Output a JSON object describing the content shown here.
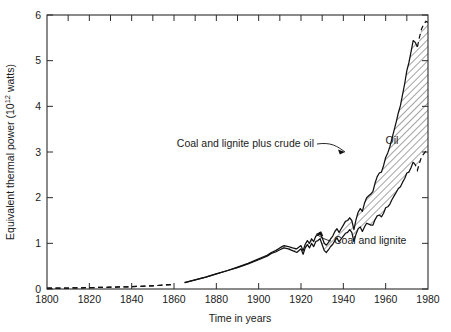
{
  "figure": {
    "background_color": "#ffffff",
    "line_color": "#111111",
    "frame_color": "#2b2b2b"
  },
  "axes": {
    "y_title": "Equivalent thermal power (10",
    "y_title_exponent": "12",
    "y_title_tail": " watts)",
    "x_title": "Time in years",
    "y_ticks": [
      "0",
      "1",
      "2",
      "3",
      "4",
      "5",
      "6"
    ],
    "x_ticks": [
      "1800",
      "1820",
      "1840",
      "1860",
      "1880",
      "1900",
      "1920",
      "1940",
      "1960",
      "1980"
    ]
  },
  "annotations": {
    "upper_curve": "Coal and lignite plus crude oil",
    "band": "Oil",
    "lower_curve": "Coal and lignite"
  },
  "chart_data": {
    "type": "area",
    "title": "",
    "subtitle": "",
    "xlabel": "Time in years",
    "ylabel": "Equivalent thermal power (10^12 watts)",
    "xlim": [
      1800,
      1980
    ],
    "ylim": [
      0,
      6
    ],
    "x_tick_interval_major": 20,
    "x_tick_interval_minor": 10,
    "y_tick_interval": 1,
    "grid": false,
    "legend": "inline-annotations",
    "hatch_region": {
      "label": "Oil",
      "between": [
        "Coal and lignite",
        "Coal and lignite plus crude oil"
      ],
      "pattern": "diagonal-45"
    },
    "series": [
      {
        "name": "Coal and lignite plus crude oil",
        "style": "solid-with-dashed-start-and-end",
        "dashed_x_ranges": [
          [
            1800,
            1862
          ],
          [
            1975,
            1980
          ]
        ],
        "x": [
          1800,
          1810,
          1820,
          1830,
          1840,
          1850,
          1860,
          1865,
          1870,
          1875,
          1880,
          1885,
          1890,
          1895,
          1900,
          1902,
          1904,
          1906,
          1908,
          1910,
          1912,
          1914,
          1916,
          1918,
          1920,
          1921,
          1922,
          1923,
          1924,
          1925,
          1926,
          1927,
          1928,
          1929,
          1930,
          1931,
          1932,
          1933,
          1934,
          1935,
          1936,
          1937,
          1938,
          1939,
          1940,
          1941,
          1942,
          1943,
          1944,
          1945,
          1946,
          1947,
          1948,
          1949,
          1950,
          1951,
          1952,
          1953,
          1954,
          1955,
          1956,
          1957,
          1958,
          1959,
          1960,
          1961,
          1962,
          1963,
          1964,
          1965,
          1966,
          1967,
          1968,
          1969,
          1970,
          1971,
          1972,
          1973,
          1974,
          1975,
          1976,
          1977,
          1978,
          1979,
          1980
        ],
        "y": [
          0.02,
          0.02,
          0.03,
          0.04,
          0.05,
          0.07,
          0.1,
          0.14,
          0.2,
          0.26,
          0.33,
          0.4,
          0.48,
          0.56,
          0.66,
          0.7,
          0.74,
          0.8,
          0.84,
          0.9,
          0.95,
          0.93,
          0.9,
          0.88,
          0.95,
          0.84,
          0.98,
          1.06,
          1.0,
          1.1,
          1.04,
          1.16,
          1.18,
          1.24,
          1.12,
          1.0,
          0.96,
          1.02,
          1.1,
          1.16,
          1.26,
          1.32,
          1.24,
          1.32,
          1.4,
          1.48,
          1.5,
          1.56,
          1.5,
          1.3,
          1.52,
          1.68,
          1.76,
          1.7,
          1.88,
          2.0,
          2.04,
          2.08,
          2.14,
          2.32,
          2.46,
          2.54,
          2.56,
          2.7,
          2.88,
          2.98,
          3.12,
          3.3,
          3.48,
          3.66,
          3.86,
          4.02,
          4.26,
          4.5,
          4.78,
          4.96,
          5.2,
          5.44,
          5.4,
          5.3,
          5.52,
          5.7,
          5.8,
          5.86,
          5.84
        ]
      },
      {
        "name": "Coal and lignite",
        "style": "solid-with-dashed-start-and-end",
        "dashed_x_ranges": [
          [
            1800,
            1862
          ],
          [
            1973,
            1980
          ]
        ],
        "x": [
          1800,
          1810,
          1820,
          1830,
          1840,
          1850,
          1860,
          1865,
          1870,
          1875,
          1880,
          1885,
          1890,
          1895,
          1900,
          1902,
          1904,
          1906,
          1908,
          1910,
          1912,
          1914,
          1916,
          1918,
          1920,
          1921,
          1922,
          1923,
          1924,
          1925,
          1926,
          1927,
          1928,
          1929,
          1930,
          1931,
          1932,
          1933,
          1934,
          1935,
          1936,
          1937,
          1938,
          1939,
          1940,
          1941,
          1942,
          1943,
          1944,
          1945,
          1946,
          1947,
          1948,
          1949,
          1950,
          1951,
          1952,
          1953,
          1954,
          1955,
          1956,
          1957,
          1958,
          1959,
          1960,
          1961,
          1962,
          1963,
          1964,
          1965,
          1966,
          1967,
          1968,
          1969,
          1970,
          1971,
          1972,
          1973,
          1974,
          1975,
          1976,
          1977,
          1978,
          1979,
          1980
        ],
        "y": [
          0.02,
          0.02,
          0.03,
          0.04,
          0.05,
          0.07,
          0.1,
          0.14,
          0.2,
          0.26,
          0.33,
          0.4,
          0.47,
          0.55,
          0.64,
          0.68,
          0.72,
          0.78,
          0.81,
          0.86,
          0.9,
          0.88,
          0.84,
          0.8,
          0.88,
          0.76,
          0.9,
          0.97,
          0.9,
          1.0,
          0.93,
          1.04,
          1.06,
          1.1,
          0.97,
          0.84,
          0.8,
          0.86,
          0.93,
          0.98,
          1.06,
          1.12,
          1.03,
          1.1,
          1.16,
          1.22,
          1.24,
          1.3,
          1.24,
          1.04,
          1.2,
          1.32,
          1.36,
          1.26,
          1.36,
          1.44,
          1.42,
          1.4,
          1.4,
          1.52,
          1.6,
          1.62,
          1.58,
          1.66,
          1.78,
          1.8,
          1.86,
          1.96,
          2.04,
          2.12,
          2.2,
          2.24,
          2.34,
          2.42,
          2.54,
          2.56,
          2.66,
          2.78,
          2.72,
          2.6,
          2.76,
          2.9,
          2.96,
          3.02,
          2.98
        ]
      }
    ]
  }
}
